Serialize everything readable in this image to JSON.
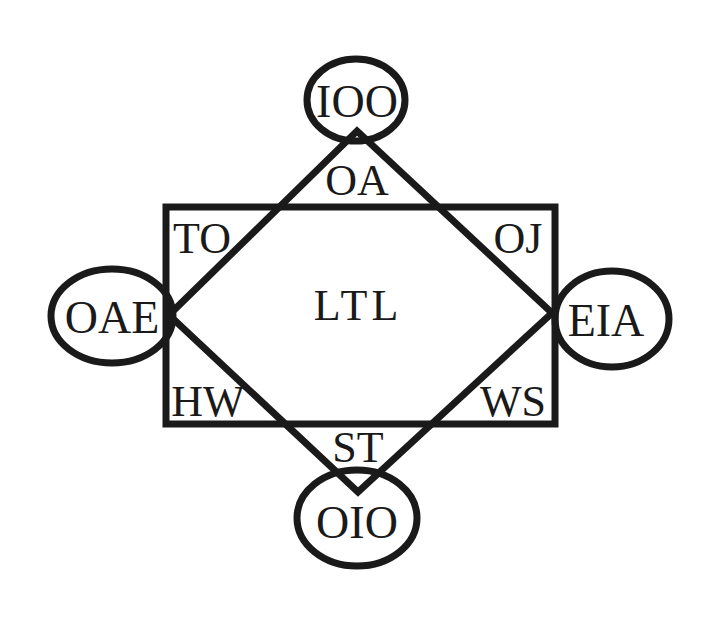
{
  "diagram": {
    "center_label": "LTL",
    "circles": [
      {
        "id": "top",
        "label": "IOO"
      },
      {
        "id": "left",
        "label": "OAE"
      },
      {
        "id": "right",
        "label": "EIA"
      },
      {
        "id": "bottom",
        "label": "OIO"
      }
    ],
    "corner_regions": [
      {
        "id": "top-middle",
        "label": "OA"
      },
      {
        "id": "top-left",
        "label": "TO"
      },
      {
        "id": "top-right",
        "label": "OJ"
      },
      {
        "id": "bottom-left",
        "label": "HW"
      },
      {
        "id": "bottom-right",
        "label": "WS"
      },
      {
        "id": "bottom-middle",
        "label": "ST"
      }
    ],
    "colors": {
      "stroke": "#1a1a1a",
      "background": "#ffffff"
    }
  }
}
